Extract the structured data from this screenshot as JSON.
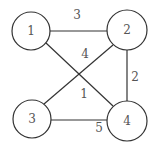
{
  "graph": {
    "nodes": [
      {
        "id": "1",
        "label": "1"
      },
      {
        "id": "2",
        "label": "2"
      },
      {
        "id": "3",
        "label": "3"
      },
      {
        "id": "4",
        "label": "4"
      }
    ],
    "edges": [
      {
        "from": "1",
        "to": "2",
        "weight": "3"
      },
      {
        "from": "3",
        "to": "2",
        "weight": "4"
      },
      {
        "from": "2",
        "to": "4",
        "weight": "2"
      },
      {
        "from": "1",
        "to": "4",
        "weight": "1"
      },
      {
        "from": "3",
        "to": "4",
        "weight": "5"
      }
    ]
  }
}
